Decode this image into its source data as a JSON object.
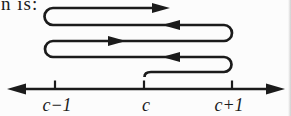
{
  "page": {
    "background_color": "#fcfcfc",
    "ink_color": "#1b1b1b",
    "text_fragment": "n is:"
  },
  "figure": {
    "type": "winding-path-over-number-line",
    "winding_path": {
      "segment_arrow_directions": [
        "right-terminal",
        "left",
        "right",
        "left"
      ],
      "start_above_tick": "c",
      "left_extent_tick": "c−1",
      "right_extent_tick": "c+1"
    },
    "number_line": {
      "left_end": "arrow",
      "right_end": "arrow",
      "tick_labels": [
        "c−1",
        "c",
        "c+1"
      ]
    }
  }
}
